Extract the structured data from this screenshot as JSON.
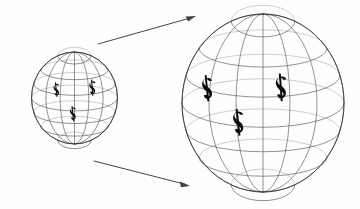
{
  "figure": {
    "title": "Two wireframe globes marked with dollar signs, connected by arrows showing expansion from small to large",
    "background_color": "#fefefe",
    "wire_color": "#4a4a4a",
    "outline_color": "#3a3a3a",
    "arrow_color": "#444444",
    "symbol_color": "#0c0c0c",
    "symbol_label": "dollar-sign",
    "symbol_character": "$"
  },
  "globes": [
    {
      "id": "small-globe",
      "label": "Small globe",
      "center_x": 74.5,
      "center_y": 98,
      "radius_x": 43,
      "radius_y": 46,
      "meridian_count": 7,
      "parallel_count": 7,
      "currency_symbols": [
        {
          "label": "dollar-sign-left",
          "x": 54,
          "y": 90,
          "size": 20,
          "rotation": -6
        },
        {
          "label": "dollar-sign-right",
          "x": 90,
          "y": 88,
          "size": 22,
          "rotation": -4
        },
        {
          "label": "dollar-sign-bottom",
          "x": 70.5,
          "y": 114,
          "size": 21,
          "rotation": -6
        }
      ]
    },
    {
      "id": "large-globe",
      "label": "Large globe",
      "center_x": 263,
      "center_y": 103,
      "radius_x": 81,
      "radius_y": 89,
      "meridian_count": 7,
      "parallel_count": 7,
      "currency_symbols": [
        {
          "label": "dollar-sign-left",
          "x": 203,
          "y": 89,
          "size": 36,
          "rotation": -6
        },
        {
          "label": "dollar-sign-right",
          "x": 277,
          "y": 88,
          "size": 38,
          "rotation": -4
        },
        {
          "label": "dollar-sign-bottom",
          "x": 234,
          "y": 123,
          "size": 37,
          "rotation": -6
        }
      ]
    }
  ],
  "arrows": [
    {
      "id": "arrow-top",
      "label": "Top expansion arrow",
      "x1": 98,
      "y1": 44,
      "x2": 196,
      "y2": 16,
      "direction": "up-right"
    },
    {
      "id": "arrow-bottom",
      "label": "Bottom expansion arrow",
      "x1": 94,
      "y1": 161,
      "x2": 190,
      "y2": 186,
      "direction": "down-right"
    }
  ]
}
